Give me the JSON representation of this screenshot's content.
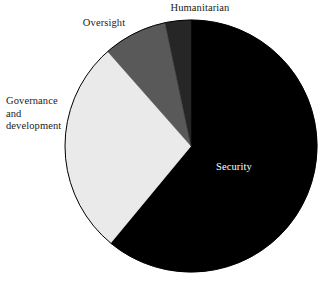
{
  "chart_data": {
    "type": "pie",
    "title": "",
    "subtitle": "",
    "xlabel": "",
    "ylabel": "",
    "legend_position": "none",
    "grid": false,
    "labels_placement": "outside-except-largest",
    "categories": [
      "Security",
      "Governance and development",
      "Oversight",
      "Humanitarian"
    ],
    "values": [
      61,
      27.5,
      8.2,
      3.3
    ],
    "units": "percent",
    "start_angle_deg": 0,
    "direction": "clockwise",
    "slices": [
      {
        "name": "Security",
        "label": "Security",
        "value": 61,
        "color": "#000000",
        "start_angle_deg": 0,
        "end_angle_deg": 219.6,
        "label_color": "#ffffff",
        "label_inside": true
      },
      {
        "name": "Governance and development",
        "label": "Governance\nand\ndevelopment",
        "value": 27.5,
        "color": "#eaeaea",
        "start_angle_deg": 219.6,
        "end_angle_deg": 318.6,
        "label_color": "#1a1a1a",
        "label_inside": false
      },
      {
        "name": "Oversight",
        "label": "Oversight",
        "value": 8.2,
        "color": "#595959",
        "start_angle_deg": 318.6,
        "end_angle_deg": 348.1,
        "label_color": "#1a1a1a",
        "label_inside": false
      },
      {
        "name": "Humanitarian",
        "label": "Humanitarian",
        "value": 3.3,
        "color": "#262626",
        "start_angle_deg": 348.1,
        "end_angle_deg": 360,
        "label_color": "#1a1a1a",
        "label_inside": false
      }
    ],
    "geometry": {
      "center_x": 191,
      "center_y": 146,
      "radius": 126
    },
    "background_color": "#ffffff",
    "outline_color": "#000000"
  }
}
